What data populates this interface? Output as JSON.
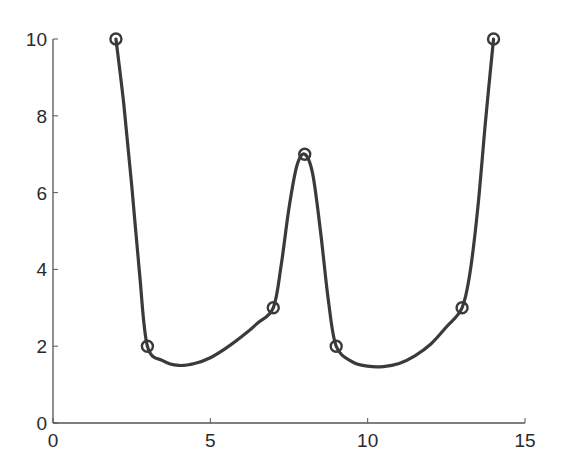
{
  "chart_data": {
    "type": "line",
    "title": "",
    "xlabel": "",
    "ylabel": "",
    "xlim": [
      0,
      15
    ],
    "ylim": [
      0,
      10
    ],
    "grid": false,
    "legend": null,
    "x_ticks": [
      0,
      5,
      10,
      15
    ],
    "y_ticks": [
      0,
      2,
      4,
      6,
      8,
      10
    ],
    "x_tick_labels": [
      "0",
      "5",
      "10",
      "15"
    ],
    "y_tick_labels": [
      "0",
      "2",
      "4",
      "6",
      "8",
      "10"
    ],
    "series": [
      {
        "name": "data points",
        "marker": "circle",
        "x": [
          2,
          3,
          7,
          8,
          9,
          13,
          14
        ],
        "y": [
          10,
          2,
          3,
          7,
          2,
          3,
          10
        ]
      },
      {
        "name": "interpolated curve",
        "style": "smooth-line",
        "x": [
          2,
          2.25,
          2.5,
          2.75,
          3,
          3.5,
          4,
          4.5,
          5,
          5.5,
          6,
          6.5,
          7,
          7.25,
          7.5,
          7.75,
          8,
          8.25,
          8.5,
          8.75,
          9,
          9.5,
          10,
          10.5,
          11,
          11.5,
          12,
          12.5,
          13,
          13.25,
          13.5,
          13.75,
          14
        ],
        "y": [
          10,
          8.3,
          6.2,
          3.9,
          2,
          1.62,
          1.5,
          1.55,
          1.7,
          1.95,
          2.25,
          2.6,
          3,
          4.1,
          5.6,
          6.7,
          7,
          6.5,
          5.0,
          3.2,
          2,
          1.6,
          1.48,
          1.47,
          1.55,
          1.75,
          2.05,
          2.5,
          3,
          3.9,
          5.6,
          7.9,
          10
        ]
      }
    ],
    "colors": {
      "line": "#3a3a3a",
      "axis": "#555555",
      "text": "#2a2a2a"
    }
  },
  "plot_area": {
    "left": 53,
    "right": 525,
    "top": 39,
    "bottom": 423
  }
}
